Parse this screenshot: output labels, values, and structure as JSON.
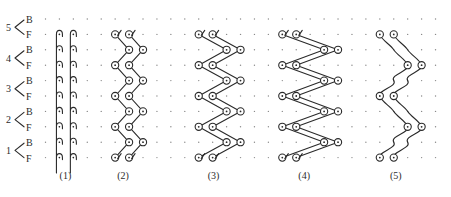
{
  "figure": {
    "rows": [
      {
        "number": "5",
        "back": "B",
        "front": "F"
      },
      {
        "number": "4",
        "back": "B",
        "front": "F"
      },
      {
        "number": "3",
        "back": "B",
        "front": "F"
      },
      {
        "number": "2",
        "back": "B",
        "front": "F"
      },
      {
        "number": "1",
        "back": "B",
        "front": "F"
      }
    ],
    "grid": {
      "columns": 29,
      "lines": 10
    },
    "panels": [
      {
        "label": "(1)",
        "type": "tuck-hooks",
        "needles": [
          1,
          2
        ]
      },
      {
        "label": "(2)",
        "type": "zigzag",
        "front_needles": [
          5,
          6
        ],
        "back_needles": [
          6,
          7
        ]
      },
      {
        "label": "(3)",
        "type": "zigzag",
        "front_needles": [
          11,
          12
        ],
        "back_needles": [
          13,
          14
        ]
      },
      {
        "label": "(4)",
        "type": "zigzag",
        "front_needles": [
          17,
          18
        ],
        "back_needles": [
          20,
          21
        ]
      },
      {
        "label": "(5)",
        "type": "float-zigzag",
        "needles_a": [
          24,
          25
        ],
        "needles_b": [
          26,
          27
        ]
      }
    ],
    "colors": {
      "ink": "#2a2a2a",
      "grid_dot": "#8a8a8a",
      "background": "#ffffff"
    }
  }
}
